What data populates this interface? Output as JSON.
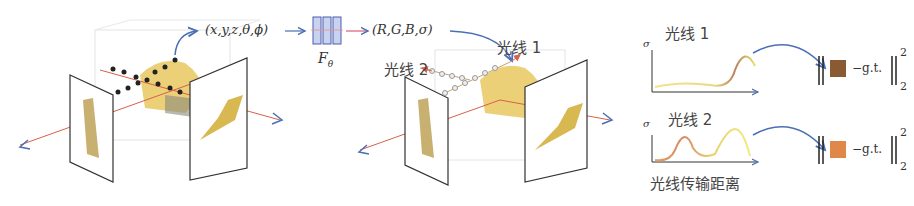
{
  "panel1": {
    "input_label": "(x,y,z,θ,ϕ)",
    "network_label": "F",
    "network_subscript": "θ"
  },
  "panel2": {
    "output_label": "(R,G,B,σ)",
    "ray1_label": "光线 1",
    "ray2_label": "光线 2",
    "ray_marker": "1"
  },
  "panel3": {
    "plot1": {
      "title": "光线 1",
      "ylabel": "σ",
      "color_square": "#8a5a32"
    },
    "plot2": {
      "title": "光线 2",
      "ylabel": "σ",
      "color_square": "#e0884a"
    },
    "xlabel": "光线传输距离",
    "loss_text": "−g.t.",
    "sup": "2",
    "sub": "2"
  },
  "colors": {
    "arrow_blue": "#4a6fb5",
    "ray_red": "#d9604a",
    "network_fill": "#c9d3ef",
    "network_stroke": "#4a5fb0",
    "frame": "#333333"
  }
}
